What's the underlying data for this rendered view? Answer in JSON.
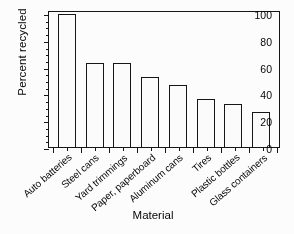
{
  "chart_data": {
    "type": "bar",
    "title": "",
    "xlabel": "Material",
    "ylabel": "Percent recycled",
    "categories": [
      "Auto batteries",
      "Steel cans",
      "Yard trimmings",
      "Paper, paperboard",
      "Aluminum cans",
      "Tires",
      "Plastic bottles",
      "Glass containers"
    ],
    "values": [
      99,
      63,
      62.5,
      52,
      46,
      35.5,
      32,
      26.5
    ],
    "ylim": [
      0,
      100
    ],
    "ytick_labels": [
      "0",
      "20",
      "40",
      "60",
      "80",
      "100"
    ],
    "ytick_values": [
      0,
      20,
      40,
      60,
      80,
      100
    ],
    "yminor_step": 5,
    "grid": false,
    "legend": null,
    "bar_style": {
      "fill": "#ffffff",
      "edge": "#111111"
    }
  }
}
